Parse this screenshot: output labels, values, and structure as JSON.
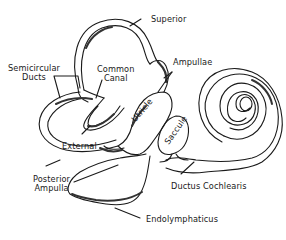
{
  "diagram": {
    "type": "anatomical line drawing",
    "stroke_color": "#1a1a1a",
    "background": "#ffffff",
    "labels": {
      "superior": "Superior",
      "semicircular_line1": "Semicircular",
      "semicircular_line2": "Ducts",
      "common_line1": "Common",
      "common_line2": "Canal",
      "ampullae": "Ampullae",
      "utricle": "Utricle",
      "saccule": "Saccule",
      "external": "External",
      "posterior_line1": "Posterior",
      "posterior_line2": "Ampulla",
      "ductus_cochlearis": "Ductus Cochlearis",
      "endolymphaticus": "Endolymphaticus"
    }
  }
}
